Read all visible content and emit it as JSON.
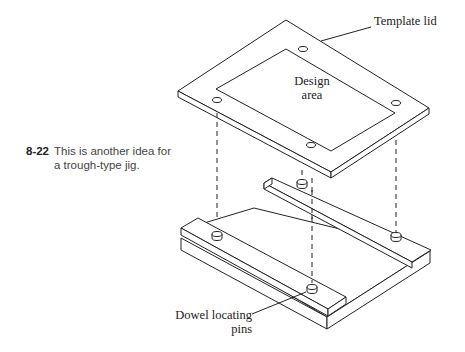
{
  "figure": {
    "number": "8-22",
    "caption": "This is another idea for a trough-type jig.",
    "caption_lines": [
      "This is another idea for",
      "a trough-type jig."
    ]
  },
  "labels": {
    "template_lid": "Template lid",
    "design_area_line1": "Design",
    "design_area_line2": "area",
    "dowel_line1": "Dowel locating",
    "dowel_line2": "pins"
  },
  "colors": {
    "stroke": "#222222",
    "background": "#ffffff"
  }
}
